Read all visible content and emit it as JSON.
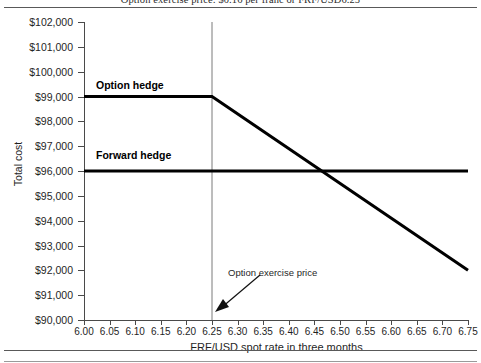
{
  "caption": "Option exercise price: $0.16 per franc or FRF/USD6.25",
  "chart_data": {
    "type": "line",
    "title": "Option exercise price: $0.16 per franc or FRF/USD6.25",
    "xlabel": "FRF/USD spot rate in three months",
    "ylabel": "Total cost",
    "xlim": [
      6.0,
      6.75
    ],
    "ylim": [
      90000,
      102000
    ],
    "grid": false,
    "legend_position": "inline-labels",
    "x_ticks": [
      "6.00",
      "6.05",
      "6.10",
      "6.15",
      "6.20",
      "6.25",
      "6.30",
      "6.35",
      "6.40",
      "6.45",
      "6.50",
      "6.55",
      "6.60",
      "6.65",
      "6.70",
      "6.75"
    ],
    "x_tick_values": [
      6.0,
      6.05,
      6.1,
      6.15,
      6.2,
      6.25,
      6.3,
      6.35,
      6.4,
      6.45,
      6.5,
      6.55,
      6.6,
      6.65,
      6.7,
      6.75
    ],
    "y_ticks": [
      "$90,000",
      "$91,000",
      "$92,000",
      "$93,000",
      "$94,000",
      "$95,000",
      "$96,000",
      "$97,000",
      "$98,000",
      "$99,000",
      "$100,000",
      "$101,000",
      "$102,000"
    ],
    "y_tick_values": [
      90000,
      91000,
      92000,
      93000,
      94000,
      95000,
      96000,
      97000,
      98000,
      99000,
      100000,
      101000,
      102000
    ],
    "series": [
      {
        "name": "Option hedge",
        "label": "Option hedge",
        "x": [
          6.0,
          6.25,
          6.75
        ],
        "values": [
          99000,
          99000,
          92000
        ]
      },
      {
        "name": "Forward hedge",
        "label": "Forward hedge",
        "x": [
          6.0,
          6.75
        ],
        "values": [
          96000,
          96000
        ]
      }
    ],
    "annotations": [
      {
        "text": "Option exercise price",
        "x": 6.25,
        "y": 90000,
        "note": "arrow points down-left to the vertical exercise-price line at 6.25"
      }
    ],
    "reference_lines": [
      {
        "name": "exercise-price-line",
        "orientation": "vertical",
        "x": 6.25
      }
    ]
  }
}
